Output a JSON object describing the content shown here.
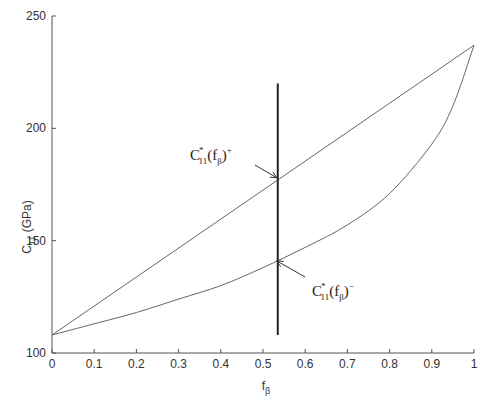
{
  "chart_data": {
    "type": "line",
    "title": "",
    "xlabel": "f",
    "xlabel_sub": "β",
    "ylabel": "C",
    "ylabel_sub": "11",
    "ylabel_unit": " (GPa)",
    "xlim": [
      0,
      1
    ],
    "ylim": [
      100,
      250
    ],
    "xticks": [
      0,
      0.1,
      0.2,
      0.3,
      0.4,
      0.5,
      0.6,
      0.7,
      0.8,
      0.9,
      1
    ],
    "xtick_labels": [
      "0",
      "0.1",
      "0.2",
      "0.3",
      "0.4",
      "0.5",
      "0.6",
      "0.7",
      "0.8",
      "0.9",
      "1"
    ],
    "yticks": [
      100,
      150,
      200,
      250
    ],
    "ytick_labels": [
      "100",
      "150",
      "200",
      "250"
    ],
    "grid": false,
    "series": [
      {
        "name": "upper-bound",
        "x": [
          0,
          1
        ],
        "values": [
          108,
          237
        ]
      },
      {
        "name": "lower-bound",
        "x": [
          0,
          0.1,
          0.2,
          0.3,
          0.4,
          0.5,
          0.6,
          0.7,
          0.8,
          0.9,
          0.95,
          1
        ],
        "values": [
          108,
          113,
          118,
          124,
          130,
          138,
          147,
          157,
          171,
          193,
          210,
          237
        ]
      }
    ],
    "vertical_line": {
      "x": 0.535,
      "y_from": 108,
      "y_to": 220
    },
    "annotations": [
      {
        "id": "upper",
        "text_main": "C",
        "text_sup": "*",
        "text_sub": "11",
        "text_arg": "(f",
        "text_arg_sub": "β",
        "text_close": ")",
        "text_sign": "+",
        "point": [
          0.535,
          178
        ]
      },
      {
        "id": "lower",
        "text_main": "C",
        "text_sup": "*",
        "text_sub": "11",
        "text_arg": "(f",
        "text_arg_sub": "β",
        "text_close": ")",
        "text_sign": "−",
        "point": [
          0.535,
          141
        ]
      }
    ]
  }
}
